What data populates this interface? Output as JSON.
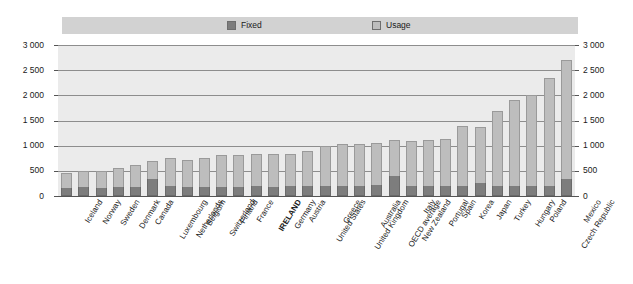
{
  "chart_data": {
    "type": "bar",
    "stacked": true,
    "title": "",
    "subtitle": "",
    "xlabel": "",
    "ylabel": "",
    "ylim": [
      0,
      3000
    ],
    "ytick_values": [
      0,
      500,
      1000,
      1500,
      2000,
      2500,
      3000
    ],
    "ytick_labels": [
      "0",
      "500",
      "1 000",
      "1 500",
      "2 000",
      "2 500",
      "3 000"
    ],
    "grid": true,
    "dual_axis": true,
    "legend_position": "top",
    "highlight_category": "IRELAND",
    "categories": [
      "Iceland",
      "Norway",
      "Sweden",
      "Denmark",
      "Canada",
      "Luxembourg",
      "Netherlands",
      "Belgium",
      "Switzerland",
      "Finland",
      "France",
      "IRELAND",
      "Germany",
      "Austria",
      "United States",
      "Greece",
      "United Kingdom",
      "Australia",
      "OECD average",
      "New Zealand",
      "Italy",
      "Portugal",
      "Spain",
      "Korea",
      "Japan",
      "Turkey",
      "Hungary",
      "Poland",
      "Czech Republic",
      "Mexico"
    ],
    "series": [
      {
        "name": "Fixed",
        "color": "#7d7d7d",
        "values": [
          150,
          170,
          160,
          170,
          175,
          330,
          190,
          180,
          175,
          185,
          185,
          190,
          185,
          190,
          190,
          200,
          195,
          200,
          210,
          400,
          195,
          200,
          200,
          195,
          250,
          195,
          200,
          200,
          190,
          330
        ]
      },
      {
        "name": "Usage",
        "color": "#bdbdbd",
        "values": [
          300,
          320,
          340,
          390,
          450,
          370,
          560,
          540,
          580,
          630,
          640,
          640,
          650,
          650,
          700,
          790,
          830,
          830,
          850,
          710,
          900,
          910,
          930,
          1200,
          1130,
          1500,
          1700,
          1800,
          2160,
          2370
        ]
      }
    ],
    "totals": [
      450,
      490,
      500,
      560,
      625,
      700,
      750,
      720,
      755,
      815,
      825,
      830,
      835,
      840,
      890,
      990,
      1025,
      1030,
      1060,
      1110,
      1095,
      1110,
      1130,
      1395,
      1380,
      1695,
      1900,
      2000,
      2350,
      2700
    ]
  },
  "legend": {
    "fixed_label": "Fixed",
    "usage_label": "Usage"
  }
}
